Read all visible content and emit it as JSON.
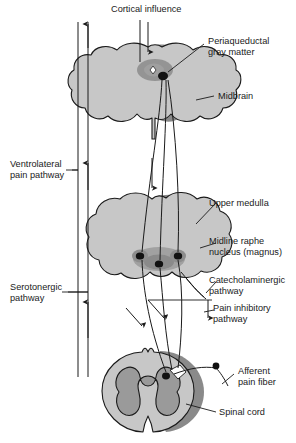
{
  "figure": {
    "type": "anatomical-diagram",
    "background_color": "#ffffff",
    "colors": {
      "tissue_light": "#c7c7c7",
      "tissue_mid": "#9c9c9c",
      "tissue_rim": "#8a8a8a",
      "tissue_dark": "#6e6e6e",
      "nucleus_dark": "#5a5a5a",
      "neuron_body": "#111111",
      "outline": "#1a1a1a",
      "label_text": "#1a1a1a"
    }
  },
  "labels": {
    "cortical_influence": "Cortical influence",
    "periaqueductal_gray_matter_line1": "Periaqueductal",
    "periaqueductal_gray_matter_line2": "gray matter",
    "midbrain": "Midbrain",
    "ventrolateral_pain_pathway_line1": "Ventrolateral",
    "ventrolateral_pain_pathway_line2": "pain pathway",
    "upper_medulla": "Upper medulla",
    "midline_raphe_nucleus_line1": "Midline raphe",
    "midline_raphe_nucleus_line2": "nucleus (magnus)",
    "catecholaminergic_pathway_line1": "Catecholaminergic",
    "catecholaminergic_pathway_line2": "pathway",
    "serotonergic_pathway_line1": "Serotonergic",
    "serotonergic_pathway_line2": "pathway",
    "pain_inhibitory_pathway_line1": "Pain inhibitory",
    "pain_inhibitory_pathway_line2": "pathway",
    "afferent_pain_fiber_line1": "Afferent",
    "afferent_pain_fiber_line2": "pain fiber",
    "spinal_cord": "Spinal cord"
  },
  "structures": [
    {
      "name": "midbrain",
      "label": "Midbrain"
    },
    {
      "name": "periaqueductal-gray",
      "label": "Periaqueductal gray matter"
    },
    {
      "name": "upper-medulla",
      "label": "Upper medulla"
    },
    {
      "name": "midline-raphe-nucleus",
      "label": "Midline raphe nucleus (magnus)"
    },
    {
      "name": "spinal-cord",
      "label": "Spinal cord"
    }
  ],
  "pathways": [
    {
      "name": "cortical-influence",
      "label": "Cortical influence",
      "direction": "descending"
    },
    {
      "name": "ventrolateral-pain-pathway",
      "label": "Ventrolateral pain pathway",
      "direction": "ascending"
    },
    {
      "name": "serotonergic-pathway",
      "label": "Serotonergic pathway",
      "direction": "ascending"
    },
    {
      "name": "catecholaminergic-pathway",
      "label": "Catecholaminergic pathway",
      "direction": "descending"
    },
    {
      "name": "pain-inhibitory-pathway",
      "label": "Pain inhibitory pathway",
      "direction": "descending"
    },
    {
      "name": "afferent-pain-fiber",
      "label": "Afferent pain fiber",
      "direction": "afferent"
    }
  ]
}
